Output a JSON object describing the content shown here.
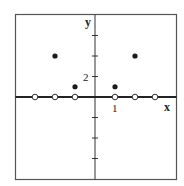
{
  "chart_data": {
    "type": "scatter",
    "title": "",
    "xlabel": "x",
    "ylabel": "y",
    "xlim": [
      -4,
      4
    ],
    "ylim": [
      -8,
      8
    ],
    "x_tick_step": 1,
    "y_tick_step": 2,
    "x_tick_labels": [
      {
        "value": 1,
        "label": "1"
      }
    ],
    "y_tick_labels": [
      {
        "value": 2,
        "label": "2"
      }
    ],
    "grid": false,
    "legend": null,
    "series": [
      {
        "name": "filled points",
        "marker": "filled-circle",
        "points": [
          [
            -2,
            4
          ],
          [
            -1,
            1
          ],
          [
            1,
            1
          ],
          [
            2,
            4
          ]
        ]
      },
      {
        "name": "open points",
        "marker": "open-circle",
        "points": [
          [
            -3,
            0
          ],
          [
            -2,
            0
          ],
          [
            -1,
            0
          ],
          [
            1,
            0
          ],
          [
            2,
            0
          ],
          [
            3,
            0
          ]
        ]
      }
    ]
  },
  "labels": {
    "x_axis": "x",
    "y_axis": "y",
    "x_tick": "1",
    "y_tick": "2"
  },
  "colors": {
    "axis": "#222222",
    "frame": "#555555",
    "point": "#1a1a1a"
  }
}
